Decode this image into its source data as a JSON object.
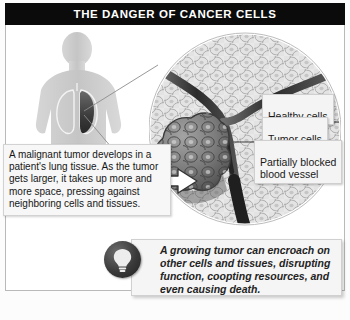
{
  "header": {
    "title": "THE DANGER OF CANCER CELLS",
    "background_color": "#0b0b0b",
    "text_color": "#ffffff"
  },
  "diagram": {
    "left_panel": {
      "figure_name": "human-torso-silhouette",
      "description": "Gray human upper-body silhouette with outlined lungs; the left-side lung contains a dark malignant tumor mass.",
      "caption": "A malignant tumor develops in a patient's lung tissue. As the tumor gets larger, it takes up more and more space, pressing against neighboring cells and tissues."
    },
    "magnified_view": {
      "name": "cell-tissue-magnification",
      "description": "Circular magnified cross-section of lung tissue showing uniform healthy cells, an irregular dark tumor mass, and a blood vessel narrowed by the tumor.",
      "labels": [
        {
          "id": "healthy-cells",
          "text": "Healthy cells"
        },
        {
          "id": "tumor-cells",
          "text": "Tumor cells"
        },
        {
          "id": "blocked-vessel",
          "text": "Partially blocked\nblood vessel"
        }
      ]
    },
    "pointer_arrow": {
      "name": "tumor-pointer-arrow",
      "direction": "right"
    }
  },
  "callout": {
    "icon": "lightbulb-icon",
    "text": "A growing tumor can encroach on other cells and tissues, disrupting function, coopting resources, and even causing death."
  },
  "colors": {
    "banner": "#0b0b0b",
    "frame_border": "#b9b9b9",
    "label_fill": "#f4f4f4",
    "body_silhouette": "#c9c9c9",
    "tumor_dark": "#4a4a4a",
    "vessel_dark": "#2e2e2e",
    "page_background": "#ffffff"
  }
}
